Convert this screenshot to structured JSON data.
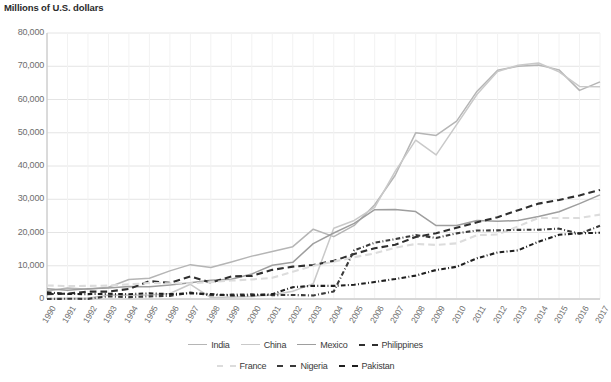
{
  "chart_title": "Millions of U.S. dollars",
  "axis": {
    "y_ticks": [
      "80,000",
      "70,000",
      "60,000",
      "50,000",
      "40,000",
      "30,000",
      "20,000",
      "10,000",
      "0"
    ],
    "x_ticks": [
      "1990",
      "1991",
      "1992",
      "1993",
      "1994",
      "1995",
      "1996",
      "1997",
      "1998",
      "1999",
      "2000",
      "2001",
      "2002",
      "2003",
      "2004",
      "2005",
      "2006",
      "2007",
      "2008",
      "2009",
      "2010",
      "2011",
      "2012",
      "2013",
      "2014",
      "2015",
      "2016",
      "2017"
    ]
  },
  "legend": {
    "row1": [
      {
        "label": "India",
        "color": "#b5b5b5",
        "dash": "none"
      },
      {
        "label": "China",
        "color": "#c9c9c9",
        "dash": "none"
      },
      {
        "label": "Mexico",
        "color": "#9e9e9e",
        "dash": "none"
      },
      {
        "label": "Philippines",
        "color": "#2f2f2f",
        "dash": "dashed"
      }
    ],
    "row2": [
      {
        "label": "France",
        "color": "#dcdcdc",
        "dash": "dashed"
      },
      {
        "label": "Nigeria",
        "color": "#3a3a3a",
        "dash": "dotted"
      },
      {
        "label": "Pakistan",
        "color": "#1f1f1f",
        "dash": "dotted"
      }
    ]
  },
  "chart_data": {
    "type": "line",
    "title": "Millions of U.S. dollars",
    "xlabel": "",
    "ylabel": "Millions of U.S. dollars",
    "ylim": [
      0,
      80000
    ],
    "ytick_step": 10000,
    "grid": true,
    "legend_position": "bottom",
    "x": [
      1990,
      1991,
      1992,
      1993,
      1994,
      1995,
      1996,
      1997,
      1998,
      1999,
      2000,
      2001,
      2002,
      2003,
      2004,
      2005,
      2006,
      2007,
      2008,
      2009,
      2010,
      2011,
      2012,
      2013,
      2014,
      2015,
      2016,
      2017
    ],
    "series": [
      {
        "name": "India",
        "color": "#b5b5b5",
        "dash": "none",
        "values": [
          2384,
          3289,
          2897,
          3522,
          5857,
          6223,
          8453,
          10331,
          9479,
          11124,
          12890,
          14273,
          15736,
          20999,
          18750,
          22125,
          28334,
          37217,
          49977,
          49204,
          53480,
          62499,
          68821,
          69970,
          70389,
          68910,
          62744,
          65292
        ]
      },
      {
        "name": "China",
        "color": "#c9c9c9",
        "dash": "none",
        "values": [
          124,
          228,
          228,
          1218,
          1164,
          1199,
          1672,
          4423,
          440,
          567,
          758,
          1234,
          2351,
          4627,
          21283,
          23626,
          27565,
          38368,
          47756,
          43324,
          52460,
          61576,
          68411,
          70285,
          70964,
          68341,
          63938,
          63860
        ]
      },
      {
        "name": "Mexico",
        "color": "#9e9e9e",
        "dash": "none",
        "values": [
          3098,
          2660,
          3070,
          3333,
          3770,
          3673,
          4224,
          4865,
          5627,
          5910,
          7525,
          10146,
          11030,
          16654,
          19861,
          22742,
          26877,
          26937,
          26304,
          22080,
          22080,
          23592,
          23366,
          23585,
          24785,
          26234,
          28691,
          31312
        ]
      },
      {
        "name": "Philippines",
        "color": "#2f2f2f",
        "dash": "dashed",
        "values": [
          1465,
          1600,
          2222,
          2230,
          3009,
          5360,
          4875,
          6794,
          4925,
          6795,
          6957,
          8769,
          9735,
          10243,
          11471,
          13566,
          15251,
          16302,
          18643,
          19766,
          21423,
          23054,
          24610,
          26717,
          28691,
          29799,
          31145,
          32808
        ]
      },
      {
        "name": "France",
        "color": "#dcdcdc",
        "dash": "dashed",
        "values": [
          4067,
          3903,
          3947,
          4038,
          4396,
          4810,
          4739,
          4727,
          5069,
          5545,
          5885,
          6367,
          8179,
          10005,
          11234,
          12575,
          13724,
          15434,
          16550,
          16260,
          16736,
          19217,
          19383,
          21843,
          24375,
          24374,
          24352,
          25378
        ]
      },
      {
        "name": "Nigeria",
        "color": "#3a3a3a",
        "dash": "dotted",
        "values": [
          10,
          66,
          46,
          802,
          550,
          804,
          947,
          1920,
          1144,
          1301,
          1392,
          1167,
          1209,
          1063,
          2273,
          14640,
          16932,
          18011,
          19206,
          18368,
          19745,
          20616,
          20633,
          20797,
          20821,
          21158,
          19640,
          22000
        ]
      },
      {
        "name": "Pakistan",
        "color": "#1f1f1f",
        "dash": "dotted",
        "values": [
          2006,
          1500,
          1468,
          1562,
          1446,
          1712,
          1461,
          1709,
          1489,
          1060,
          1075,
          1461,
          3554,
          3964,
          3945,
          4280,
          5121,
          5998,
          7039,
          8717,
          9690,
          12263,
          14007,
          14629,
          17244,
          19306,
          19768,
          19914
        ]
      }
    ]
  }
}
